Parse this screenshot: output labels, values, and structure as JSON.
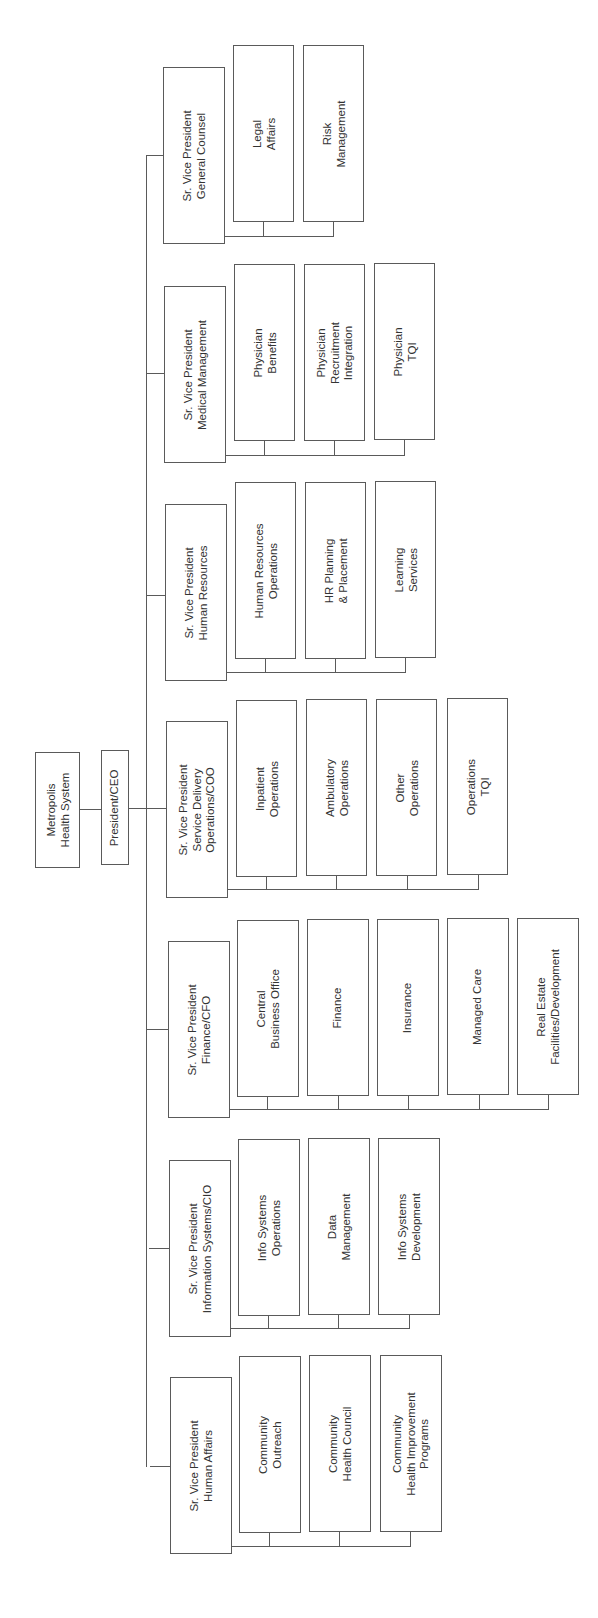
{
  "diagram": {
    "type": "org-chart",
    "orientation": "rotated-90-ccw",
    "root": {
      "label": "Metropolis\nHealth System"
    },
    "ceo": {
      "label": "President/CEO"
    },
    "line_color": "#5a5a5a",
    "groups": [
      {
        "head": "Sr. Vice President\nGeneral Counsel",
        "children": [
          "Legal\nAffairs",
          "Risk\nManagement"
        ]
      },
      {
        "head": "Sr. Vice President\nMedical Management",
        "children": [
          "Physician\nBenefits",
          "Physician\nRecruitment\nIntegration",
          "Physician\nTQI"
        ]
      },
      {
        "head": "Sr. Vice President\nHuman Resources",
        "children": [
          "Human Resources\nOperations",
          "HR Planning\n& Placement",
          "Learning\nServices"
        ]
      },
      {
        "head": "Sr. Vice President\nService Delivery\nOperations/COO",
        "children": [
          "Inpatient\nOperations",
          "Ambulatory\nOperations",
          "Other\nOperations",
          "Operations\nTQI"
        ]
      },
      {
        "head": "Sr. Vice President\nFinance/CFO",
        "children": [
          "Central\nBusiness Office",
          "Finance",
          "Insurance",
          "Managed Care",
          "Real Estate\nFacilities/Development"
        ]
      },
      {
        "head": "Sr. Vice President\nInformation Systems/CIO",
        "children": [
          "Info Systems\nOperations",
          "Data\nManagement",
          "Info Systems\nDevelopment"
        ]
      },
      {
        "head": "Sr. Vice President\nHuman Affairs",
        "children": [
          "Community\nOutreach",
          "Community\nHealth Council",
          "Community\nHealth Improvement\nPrograms"
        ]
      }
    ]
  }
}
